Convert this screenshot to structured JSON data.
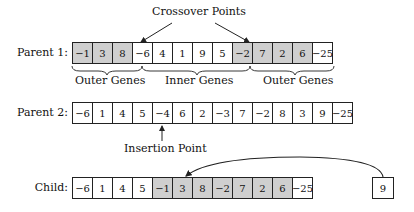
{
  "annotations": {
    "crossover_points": "Crossover Points",
    "insertion_point": "Insertion Point",
    "braces": [
      "Outer Genes",
      "Inner Genes",
      "Outer Genes"
    ]
  },
  "rows": {
    "parent1": {
      "label": "Parent 1:",
      "genes": [
        "−1",
        "3",
        "8",
        "−6",
        "4",
        "1",
        "9",
        "5",
        "−2",
        "7",
        "2",
        "6",
        "−25"
      ],
      "shaded": [
        true,
        true,
        true,
        false,
        false,
        false,
        false,
        false,
        true,
        true,
        true,
        true,
        false
      ]
    },
    "parent2": {
      "label": "Parent 2:",
      "genes": [
        "−6",
        "1",
        "4",
        "5",
        "−4",
        "6",
        "2",
        "−3",
        "7",
        "−2",
        "8",
        "3",
        "9",
        "−25"
      ],
      "shaded": [
        false,
        false,
        false,
        false,
        false,
        false,
        false,
        false,
        false,
        false,
        false,
        false,
        false,
        false
      ]
    },
    "child": {
      "label": "Child:",
      "genes": [
        "−6",
        "1",
        "4",
        "5",
        "−1",
        "3",
        "8",
        "−2",
        "7",
        "2",
        "6",
        "−25"
      ],
      "shaded": [
        false,
        false,
        false,
        false,
        true,
        true,
        true,
        true,
        true,
        true,
        true,
        false
      ]
    },
    "moved_gene": "9"
  },
  "colors": {
    "shaded_cell": "#cfcfcf",
    "border": "#222222"
  }
}
